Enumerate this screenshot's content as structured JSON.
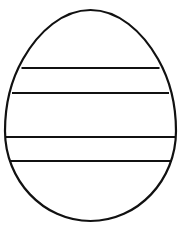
{
  "image": {
    "title": "Easter Egg Coloring Outline",
    "description": "Black line-art outline of an egg with four horizontal stripe lines across it",
    "subject": "egg",
    "style": "coloring-page-line-art",
    "width": 188,
    "height": 234
  },
  "colors": {
    "background": "#ffffff",
    "stroke": "#111111",
    "fill": "#ffffff"
  },
  "egg": {
    "name": "egg-outline",
    "stroke_width": 2.2,
    "bounds": {
      "left": 5,
      "right": 176,
      "top": 10,
      "bottom": 221
    },
    "center_x": 90.5,
    "widest_y": 131,
    "path": "M 90.5 10 C 118 10 142 31 158 59 C 170 80 176 106 176 131 C 176 180 138 221 90.5 221 C 43 221 5 180 5 131 C 5 106 11 80 23 59 C 39 31 63 10 90.5 10 Z"
  },
  "stripes": {
    "count": 4,
    "stroke_width": 2.2,
    "lines": [
      {
        "name": "stripe-line-1",
        "y": 68,
        "x1": 21.5,
        "x2": 159.5
      },
      {
        "name": "stripe-line-2",
        "y": 93,
        "x1": 12.0,
        "x2": 169.0
      },
      {
        "name": "stripe-line-3",
        "y": 137,
        "x1": 5.3,
        "x2": 175.7
      },
      {
        "name": "stripe-line-4",
        "y": 161,
        "x1": 9.0,
        "x2": 172.0
      }
    ],
    "bands": [
      {
        "name": "band-top",
        "from_y": 10,
        "to_y": 68,
        "height": 58
      },
      {
        "name": "band-narrow-upper",
        "from_y": 68,
        "to_y": 93,
        "height": 25
      },
      {
        "name": "band-wide-middle",
        "from_y": 93,
        "to_y": 137,
        "height": 44
      },
      {
        "name": "band-narrow-lower",
        "from_y": 137,
        "to_y": 161,
        "height": 24
      },
      {
        "name": "band-bottom",
        "from_y": 161,
        "to_y": 221,
        "height": 60
      }
    ]
  }
}
